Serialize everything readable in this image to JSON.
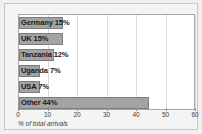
{
  "chart_data": {
    "type": "bar",
    "orientation": "horizontal",
    "title": "",
    "subtitle": "",
    "xlabel": "% of total arrivals",
    "ylabel": "",
    "categories": [
      "Germany",
      "UK",
      "Tanzania",
      "Uganda",
      "USA",
      "Other"
    ],
    "values": [
      15,
      15,
      12,
      7,
      7,
      44
    ],
    "bar_labels": [
      "Germany 15%",
      "UK 15%",
      "Tanzania 12%",
      "Uganda 7%",
      "USA 7%",
      "Other 44%"
    ],
    "xlim": [
      0,
      60
    ],
    "xticks": [
      0,
      10,
      20,
      30,
      40,
      50,
      60
    ],
    "xtick_labels": [
      "0",
      "10",
      "20",
      "30",
      "40",
      "50",
      "60"
    ],
    "grid": true,
    "grid_axis": "x",
    "legend": false,
    "colors": {
      "bar_fill": "#a3a3a3",
      "bar_edge": "#7d7d7d",
      "plot_background": "#ffffff",
      "figure_background": "#f0f0f0",
      "gridline": "#dcdcdc",
      "axis": "#a6a6a6",
      "text": "#1a1a1a",
      "tick_text": "#3d3d3d"
    }
  }
}
